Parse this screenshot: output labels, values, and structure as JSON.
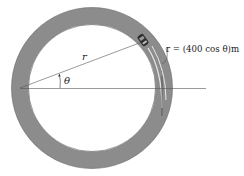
{
  "diagram": {
    "labels": {
      "r": "r",
      "theta": "θ",
      "equation": "r = (400 cos θ)m"
    },
    "colors": {
      "track": "#8c8c8c",
      "track_edge": "#5a5a5a",
      "line": "#555555",
      "background": "#ffffff",
      "car": "#333333"
    }
  }
}
